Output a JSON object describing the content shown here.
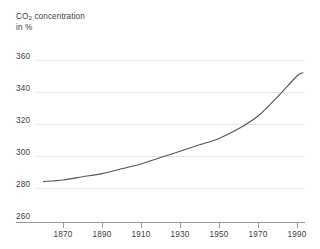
{
  "chart_data": {
    "type": "line",
    "title": "CO2 concentration",
    "title_rich": {
      "prefix": "CO",
      "sub": "2",
      "suffix": " concentration"
    },
    "subtitle": "in %",
    "xlabel": "",
    "ylabel": "",
    "xlim": [
      1860,
      1995
    ],
    "ylim": [
      260,
      360
    ],
    "grid": true,
    "legend": "none",
    "y_ticks": [
      360,
      340,
      320,
      300,
      280,
      260
    ],
    "x_ticks": [
      1870,
      1890,
      1910,
      1930,
      1950,
      1970,
      1990
    ],
    "series": [
      {
        "name": "CO2 concentration",
        "color": "#555555",
        "x": [
          1860,
          1870,
          1880,
          1890,
          1900,
          1910,
          1920,
          1930,
          1940,
          1950,
          1960,
          1970,
          1980,
          1990,
          1993
        ],
        "values": [
          284,
          285,
          287,
          289,
          292,
          295,
          299,
          303,
          307,
          311,
          317,
          325,
          337,
          350,
          352
        ]
      }
    ]
  },
  "axis": {
    "y_tick_labels": [
      "360",
      "340",
      "320",
      "300",
      "280",
      "260"
    ],
    "x_tick_labels": [
      "1870",
      "1890",
      "1910",
      "1930",
      "1950",
      "1970",
      "1990"
    ]
  },
  "colors": {
    "curve": "#555555",
    "gridline": "#e6e6e6",
    "axis": "#9a9a9a",
    "text": "#3d3d3d",
    "background": "#ffffff"
  }
}
